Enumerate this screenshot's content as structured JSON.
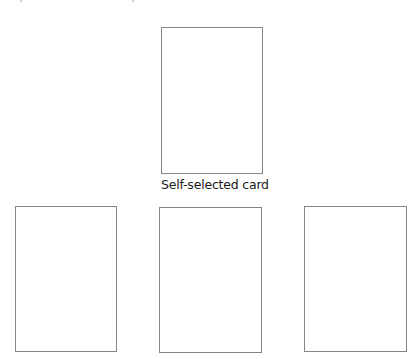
{
  "diagram": {
    "top_card": {
      "label": "Self-selected card"
    },
    "bottom_cards": [
      {
        "position": "left"
      },
      {
        "position": "middle"
      },
      {
        "position": "right"
      }
    ],
    "colors": {
      "card_border": "#858585",
      "background": "#ffffff",
      "label_text": "#1a1a1a"
    }
  }
}
